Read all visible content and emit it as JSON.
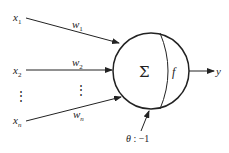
{
  "diagram": {
    "type": "artificial-neuron-model",
    "inputs": [
      {
        "name": "x",
        "sub": "1",
        "weight": "w",
        "weight_sub": "1"
      },
      {
        "name": "x",
        "sub": "2",
        "weight": "w",
        "weight_sub": "2"
      },
      {
        "name": "x",
        "sub": "n",
        "weight": "w",
        "weight_sub": "n"
      }
    ],
    "ellipsis": "⋮",
    "summation_symbol": "Σ",
    "activation_symbol": "f",
    "output": "y",
    "threshold": {
      "symbol": "θ",
      "text": " : −1"
    }
  }
}
